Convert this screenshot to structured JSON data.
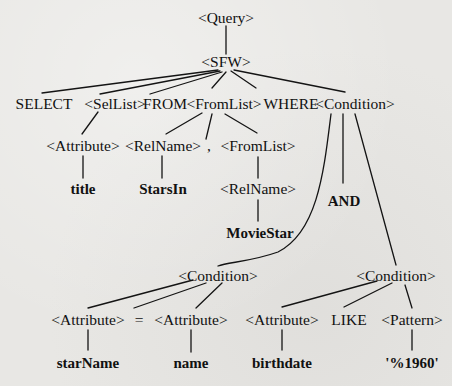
{
  "diagram": {
    "type": "parse-tree",
    "root": {
      "label": "<Query>",
      "children": [
        {
          "label": "<SFW>",
          "children": [
            {
              "label": "SELECT"
            },
            {
              "label": "<SelList>",
              "children": [
                {
                  "label": "<Attribute>",
                  "children": [
                    {
                      "label": "title"
                    }
                  ]
                }
              ]
            },
            {
              "label": "FROM"
            },
            {
              "label": "<FromList>",
              "children": [
                {
                  "label": "<RelName>",
                  "children": [
                    {
                      "label": "StarsIn"
                    }
                  ]
                },
                {
                  "label": ","
                },
                {
                  "label": "<FromList>",
                  "children": [
                    {
                      "label": "<RelName>",
                      "children": [
                        {
                          "label": "MovieStar"
                        }
                      ]
                    }
                  ]
                }
              ]
            },
            {
              "label": "WHERE"
            },
            {
              "label": "<Condition>",
              "children": [
                {
                  "label": "<Condition>",
                  "children": [
                    {
                      "label": "<Attribute>",
                      "children": [
                        {
                          "label": "starName"
                        }
                      ]
                    },
                    {
                      "label": "="
                    },
                    {
                      "label": "<Attribute>",
                      "children": [
                        {
                          "label": "name"
                        }
                      ]
                    }
                  ]
                },
                {
                  "label": "AND"
                },
                {
                  "label": "<Condition>",
                  "children": [
                    {
                      "label": "<Attribute>",
                      "children": [
                        {
                          "label": "birthdate"
                        }
                      ]
                    },
                    {
                      "label": "LIKE"
                    },
                    {
                      "label": "<Pattern>",
                      "children": [
                        {
                          "label": "'%1960'"
                        }
                      ]
                    }
                  ]
                }
              ]
            }
          ]
        }
      ]
    }
  },
  "nodes": {
    "query": "<Query>",
    "sfw": "<SFW>",
    "select_kw": "SELECT",
    "sellist": "<SelList>",
    "from_kw": "FROM",
    "fromlist": "<FromList>",
    "where_kw": "WHERE",
    "condition_top": "<Condition>",
    "attribute_title": "<Attribute>",
    "relname_starsin": "<RelName>",
    "comma": ",",
    "fromlist_inner": "<FromList>",
    "leaf_title": "title",
    "leaf_starsin": "StarsIn",
    "relname_moviestar": "<RelName>",
    "and_kw": "AND",
    "leaf_moviestar": "MovieStar",
    "condition_left": "<Condition>",
    "condition_right": "<Condition>",
    "attribute_starname": "<Attribute>",
    "equals": "=",
    "attribute_name": "<Attribute>",
    "attribute_birthdate": "<Attribute>",
    "like_kw": "LIKE",
    "pattern": "<Pattern>",
    "leaf_starname": "starName",
    "leaf_name": "name",
    "leaf_birthdate": "birthdate",
    "leaf_pattern": "'%1960'"
  }
}
